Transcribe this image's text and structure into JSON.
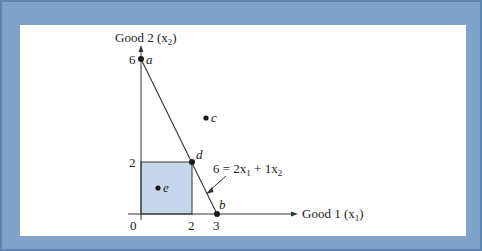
{
  "figure": {
    "type": "budget-set-diagram",
    "x_axis_label": "Good 1 (x",
    "x_axis_sub": "1",
    "x_axis_label_end": ")",
    "y_axis_label": "Good 2 (x",
    "y_axis_sub": "2",
    "y_axis_label_end": ")",
    "origin_label": "0",
    "x_ticks": [
      {
        "value": 2,
        "label": "2"
      },
      {
        "value": 3,
        "label": "3"
      }
    ],
    "y_ticks": [
      {
        "value": 2,
        "label": "2"
      },
      {
        "value": 6,
        "label": "6"
      }
    ],
    "budget_line": {
      "equation_lhs": "6 = 2x",
      "sub1": "1",
      "middle": " + 1x",
      "sub2": "2",
      "from": [
        0,
        6
      ],
      "to": [
        3,
        0
      ]
    },
    "points": [
      {
        "id": "a",
        "label": "a",
        "x": 0,
        "y": 6
      },
      {
        "id": "b",
        "label": "b",
        "x": 3,
        "y": 0
      },
      {
        "id": "c",
        "label": "c",
        "x": 2.5,
        "y": 3.7
      },
      {
        "id": "d",
        "label": "d",
        "x": 2,
        "y": 2
      },
      {
        "id": "e",
        "label": "e",
        "x": 0.6,
        "y": 1
      }
    ],
    "shaded_region": {
      "x_from": 0,
      "x_to": 2,
      "y_from": 0,
      "y_to": 2
    },
    "colors": {
      "frame_blue": "#7fa3c9",
      "frame_edge": "#5f86b0",
      "shade_fill": "#c6d6ea",
      "line": "#333333",
      "point": "#1a1a1a"
    }
  }
}
